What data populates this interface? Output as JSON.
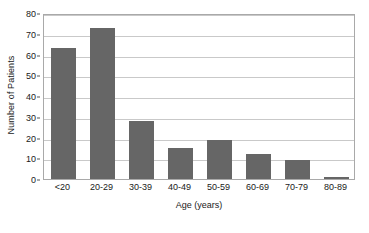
{
  "chart_data": {
    "type": "bar",
    "title": "",
    "xlabel": "Age (years)",
    "ylabel": "Number of Patients",
    "categories": [
      "<20",
      "20-29",
      "30-39",
      "40-49",
      "50-59",
      "60-69",
      "70-79",
      "80-89"
    ],
    "values": [
      63,
      73,
      28,
      15,
      19,
      12,
      9,
      1
    ],
    "ylim": [
      0,
      80
    ],
    "yticks": [
      0,
      10,
      20,
      30,
      40,
      50,
      60,
      70,
      80
    ],
    "ytick_labels": [
      "0",
      "10",
      "20",
      "30",
      "40",
      "50",
      "60",
      "70",
      "80"
    ],
    "grid": true,
    "grid_axis": "y",
    "legend": false,
    "bar_color": "#666666",
    "plot_border_color": "#a9a9a9",
    "gridline_color": "#c9c9c9",
    "background_color": "#ffffff",
    "series": [
      {
        "name": "Number of Patients",
        "values": [
          63,
          73,
          28,
          15,
          19,
          12,
          9,
          1
        ]
      }
    ]
  }
}
